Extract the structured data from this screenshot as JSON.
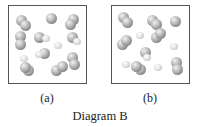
{
  "diagram": {
    "caption": "Diagram B",
    "panels": [
      {
        "label": "(a)",
        "atoms": [
          {
            "type": "big",
            "x": 12,
            "y": 14
          },
          {
            "type": "big",
            "x": 16,
            "y": 19
          },
          {
            "type": "big",
            "x": 42,
            "y": 12
          },
          {
            "type": "big",
            "x": 64,
            "y": 13
          },
          {
            "type": "big",
            "x": 61,
            "y": 18
          },
          {
            "type": "big",
            "x": 11,
            "y": 30
          },
          {
            "type": "big",
            "x": 11,
            "y": 38
          },
          {
            "type": "big",
            "x": 30,
            "y": 31
          },
          {
            "type": "small",
            "x": 37,
            "y": 33
          },
          {
            "type": "small",
            "x": 49,
            "y": 40
          },
          {
            "type": "big",
            "x": 63,
            "y": 31
          },
          {
            "type": "small",
            "x": 68,
            "y": 36
          },
          {
            "type": "big",
            "x": 35,
            "y": 47
          },
          {
            "type": "small",
            "x": 30,
            "y": 49
          },
          {
            "type": "small",
            "x": 15,
            "y": 53
          },
          {
            "type": "big",
            "x": 63,
            "y": 51
          },
          {
            "type": "big",
            "x": 65,
            "y": 58
          },
          {
            "type": "big",
            "x": 19,
            "y": 64
          },
          {
            "type": "big",
            "x": 16,
            "y": 61
          },
          {
            "type": "big",
            "x": 47,
            "y": 64
          },
          {
            "type": "big",
            "x": 53,
            "y": 60
          }
        ]
      },
      {
        "label": "(b)",
        "atoms": [
          {
            "type": "big",
            "x": 11,
            "y": 11
          },
          {
            "type": "big",
            "x": 15,
            "y": 16
          },
          {
            "type": "big",
            "x": 40,
            "y": 14
          },
          {
            "type": "big",
            "x": 44,
            "y": 18
          },
          {
            "type": "big",
            "x": 63,
            "y": 15
          },
          {
            "type": "small",
            "x": 28,
            "y": 30
          },
          {
            "type": "big",
            "x": 10,
            "y": 38
          },
          {
            "type": "big",
            "x": 14,
            "y": 34
          },
          {
            "type": "big",
            "x": 44,
            "y": 31
          },
          {
            "type": "big",
            "x": 48,
            "y": 27
          },
          {
            "type": "small",
            "x": 62,
            "y": 41
          },
          {
            "type": "big",
            "x": 33,
            "y": 46
          },
          {
            "type": "small",
            "x": 35,
            "y": 52
          },
          {
            "type": "small",
            "x": 14,
            "y": 59
          },
          {
            "type": "big",
            "x": 28,
            "y": 63
          },
          {
            "type": "big",
            "x": 24,
            "y": 60
          },
          {
            "type": "small",
            "x": 46,
            "y": 62
          },
          {
            "type": "big",
            "x": 64,
            "y": 56
          },
          {
            "type": "big",
            "x": 65,
            "y": 63
          }
        ]
      }
    ]
  }
}
